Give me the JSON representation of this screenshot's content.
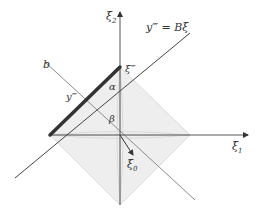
{
  "diagram": {
    "axes": {
      "xi1_label": "ξ",
      "xi1_sub": "1",
      "xi2_label": "ξ",
      "xi2_sub": "2"
    },
    "lines": {
      "image_line_label": "y‴ = Bξ",
      "b_label": "b"
    },
    "points": {
      "xi_triple_prime": "ξ‴",
      "y_triple_prime": "y‴",
      "xi0_label": "ξ",
      "xi0_sub": "0"
    },
    "angles": {
      "alpha": "α",
      "beta": "β"
    },
    "colors": {
      "axis": "#444444",
      "thick_segment": "#333333",
      "diamond_fill": "#eeeeee",
      "diamond_edge": "#dcdcdc",
      "b_line": "#888888"
    }
  }
}
